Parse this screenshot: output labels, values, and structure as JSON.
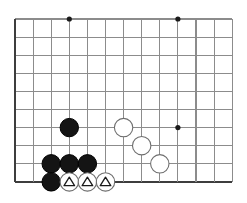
{
  "figure": {
    "name": "go-board-corner-diagram",
    "type": "go-board",
    "width": 247,
    "height": 203,
    "background_color": "#ffffff"
  },
  "board": {
    "origin_x": 15,
    "origin_y": 19,
    "spacing": 18.1,
    "columns": 12,
    "rows": 9,
    "edge_left_index": 0,
    "edge_bottom_index": 9,
    "grid_color": "#8c8c8c",
    "edge_color": "#3d3d3d",
    "grid_line_width": 1.1,
    "edge_line_width": 2.2,
    "grid_right_extent": 232,
    "grid_top_extent": 19,
    "star_points": [
      {
        "col": 3,
        "row": 0,
        "name": "star-point-top-left"
      },
      {
        "col": 9,
        "row": 0,
        "name": "star-point-top-right"
      },
      {
        "col": 9,
        "row": 6,
        "name": "star-point-bottom-right"
      }
    ],
    "star_radius": 2.6,
    "star_color": "#1a1a1a"
  },
  "stones": {
    "radius": 9.2,
    "black_fill": "#141414",
    "black_stroke": "#000000",
    "white_fill": "#ffffff",
    "white_stroke": "#6e6e6e",
    "white_stroke_width": 1.1,
    "mark_color": "#1a1a1a",
    "list": [
      {
        "color": "black",
        "col": 3,
        "row": 6,
        "mark": "none",
        "name": "black-stone-c3-r6"
      },
      {
        "color": "black",
        "col": 2,
        "row": 8,
        "mark": "none",
        "name": "black-stone-c2-r8"
      },
      {
        "color": "black",
        "col": 3,
        "row": 8,
        "mark": "none",
        "name": "black-stone-c3-r8"
      },
      {
        "color": "black",
        "col": 4,
        "row": 8,
        "mark": "none",
        "name": "black-stone-c4-r8"
      },
      {
        "color": "black",
        "col": 2,
        "row": 9,
        "mark": "none",
        "name": "black-stone-c2-r9"
      },
      {
        "color": "white",
        "col": 6,
        "row": 6,
        "mark": "none",
        "name": "white-stone-c6-r6"
      },
      {
        "color": "white",
        "col": 7,
        "row": 7,
        "mark": "none",
        "name": "white-stone-c7-r7"
      },
      {
        "color": "white",
        "col": 8,
        "row": 8,
        "mark": "none",
        "name": "white-stone-c8-r8"
      },
      {
        "color": "white",
        "col": 3,
        "row": 9,
        "mark": "triangle",
        "name": "white-stone-triangle-c3-r9"
      },
      {
        "color": "white",
        "col": 4,
        "row": 9,
        "mark": "triangle",
        "name": "white-stone-triangle-c4-r9"
      },
      {
        "color": "white",
        "col": 5,
        "row": 9,
        "mark": "triangle",
        "name": "white-stone-triangle-c5-r9"
      }
    ]
  },
  "marks": {
    "triangle_size": 9.4,
    "triangle_stroke_width": 1.3
  }
}
